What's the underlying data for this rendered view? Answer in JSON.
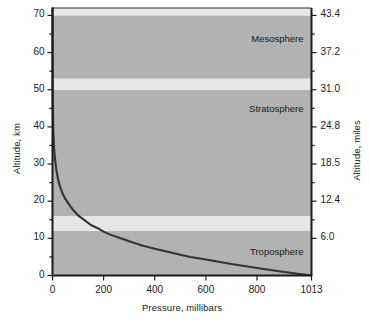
{
  "chart_data": {
    "type": "line",
    "title": "",
    "xlabel": "Pressure, millibars",
    "ylabel": "Altitude, km",
    "ylabel_right": "Altitude, miles",
    "xlim": [
      0,
      1013
    ],
    "ylim": [
      0,
      72
    ],
    "grid": false,
    "legend": null,
    "x_ticks": [
      {
        "value": 0,
        "label": "0"
      },
      {
        "value": 200,
        "label": "200"
      },
      {
        "value": 400,
        "label": "400"
      },
      {
        "value": 600,
        "label": "600"
      },
      {
        "value": 800,
        "label": "800"
      },
      {
        "value": 1013,
        "label": "1013"
      }
    ],
    "y_ticks_left": [
      {
        "value": 0,
        "label": "0"
      },
      {
        "value": 5,
        "label": ""
      },
      {
        "value": 10,
        "label": "10"
      },
      {
        "value": 15,
        "label": ""
      },
      {
        "value": 20,
        "label": "20"
      },
      {
        "value": 25,
        "label": ""
      },
      {
        "value": 30,
        "label": "30"
      },
      {
        "value": 35,
        "label": ""
      },
      {
        "value": 40,
        "label": "40"
      },
      {
        "value": 45,
        "label": ""
      },
      {
        "value": 50,
        "label": "50"
      },
      {
        "value": 55,
        "label": ""
      },
      {
        "value": 60,
        "label": "60"
      },
      {
        "value": 65,
        "label": ""
      },
      {
        "value": 70,
        "label": "70"
      }
    ],
    "y_ticks_right": [
      {
        "value": 10,
        "label": "6.0"
      },
      {
        "value": 15,
        "label": ""
      },
      {
        "value": 20,
        "label": "12.4"
      },
      {
        "value": 25,
        "label": ""
      },
      {
        "value": 30,
        "label": "18.5"
      },
      {
        "value": 35,
        "label": ""
      },
      {
        "value": 40,
        "label": "24.8"
      },
      {
        "value": 45,
        "label": ""
      },
      {
        "value": 50,
        "label": "31.0"
      },
      {
        "value": 55,
        "label": ""
      },
      {
        "value": 60,
        "label": "37.2"
      },
      {
        "value": 65,
        "label": ""
      },
      {
        "value": 70,
        "label": "43.4"
      }
    ],
    "bands": [
      {
        "name": "Troposphere",
        "y0": 0,
        "y1": 12,
        "shade": "dark",
        "label": "Troposphere",
        "label_y": 6.0
      },
      {
        "name": "Tropopause",
        "y0": 12,
        "y1": 16,
        "shade": "light",
        "label": "",
        "label_y": null
      },
      {
        "name": "Stratosphere",
        "y0": 16,
        "y1": 50,
        "shade": "dark",
        "label": "Stratosphere",
        "label_y": 44.5
      },
      {
        "name": "Stratopause",
        "y0": 50,
        "y1": 53,
        "shade": "light",
        "label": "",
        "label_y": null
      },
      {
        "name": "Mesosphere",
        "y0": 53,
        "y1": 70,
        "shade": "dark",
        "label": "Mesosphere",
        "label_y": 63.5
      },
      {
        "name": "Mesopause",
        "y0": 70,
        "y1": 72,
        "shade": "light",
        "label": "",
        "label_y": null
      }
    ],
    "series": [
      {
        "name": "Atmospheric pressure vs altitude",
        "color": "#333333",
        "points": [
          {
            "p": 1013,
            "km": 0
          },
          {
            "p": 900,
            "km": 1.0
          },
          {
            "p": 800,
            "km": 2.0
          },
          {
            "p": 700,
            "km": 3.1
          },
          {
            "p": 600,
            "km": 4.3
          },
          {
            "p": 540,
            "km": 5.0
          },
          {
            "p": 500,
            "km": 5.6
          },
          {
            "p": 450,
            "km": 6.4
          },
          {
            "p": 400,
            "km": 7.2
          },
          {
            "p": 350,
            "km": 8.1
          },
          {
            "p": 300,
            "km": 9.2
          },
          {
            "p": 250,
            "km": 10.4
          },
          {
            "p": 226,
            "km": 11.0
          },
          {
            "p": 200,
            "km": 11.8
          },
          {
            "p": 175,
            "km": 12.8
          },
          {
            "p": 150,
            "km": 13.6
          },
          {
            "p": 125,
            "km": 14.9
          },
          {
            "p": 100,
            "km": 16.2
          },
          {
            "p": 80,
            "km": 17.7
          },
          {
            "p": 70,
            "km": 18.6
          },
          {
            "p": 60,
            "km": 19.6
          },
          {
            "p": 50,
            "km": 20.6
          },
          {
            "p": 40,
            "km": 22.0
          },
          {
            "p": 30,
            "km": 23.8
          },
          {
            "p": 25,
            "km": 25.0
          },
          {
            "p": 20,
            "km": 26.5
          },
          {
            "p": 15,
            "km": 28.5
          },
          {
            "p": 10,
            "km": 31.2
          },
          {
            "p": 7,
            "km": 33.4
          },
          {
            "p": 5,
            "km": 35.8
          },
          {
            "p": 3,
            "km": 39.0
          },
          {
            "p": 2,
            "km": 42.4
          },
          {
            "p": 1,
            "km": 47.8
          },
          {
            "p": 0.5,
            "km": 52.4
          },
          {
            "p": 0.2,
            "km": 59.0
          },
          {
            "p": 0.1,
            "km": 64.0
          },
          {
            "p": 0.05,
            "km": 68.5
          },
          {
            "p": 0.03,
            "km": 72.0
          }
        ]
      }
    ],
    "colors": {
      "band_dark": "#b2b2b2",
      "band_light": "#e6e6e6",
      "curve": "#333333",
      "axis": "#1a1a1a",
      "text": "#1a1a1a",
      "background": "#ffffff"
    }
  }
}
